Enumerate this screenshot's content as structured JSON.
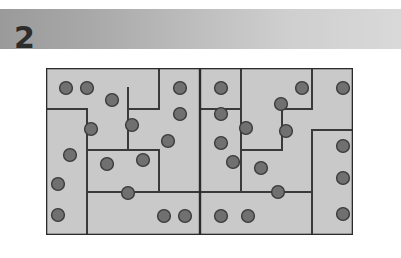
{
  "header": {
    "number_label": "2",
    "band_gradient_from": "#9a9a9a",
    "band_gradient_to": "#d9d9d9"
  },
  "puzzle": {
    "name": "dotted-region-grid-puzzle",
    "grid": {
      "columns": 15,
      "rows": 8,
      "cell_size": 20.45,
      "origin_x": 0,
      "origin_y": 0,
      "width": 307,
      "height": 167
    },
    "colors": {
      "background": "#c9c9c9",
      "border": "#2b2b2b",
      "region_line": "#3a3a3a",
      "dot_fill": "#707070",
      "dot_stroke": "#3b3b3b"
    },
    "center_divider_x": 154,
    "dots": [
      {
        "cx": 20,
        "cy": 20
      },
      {
        "cx": 41,
        "cy": 20
      },
      {
        "cx": 66,
        "cy": 32
      },
      {
        "cx": 134,
        "cy": 20
      },
      {
        "cx": 175,
        "cy": 20
      },
      {
        "cx": 256,
        "cy": 20
      },
      {
        "cx": 297,
        "cy": 20
      },
      {
        "cx": 134,
        "cy": 46
      },
      {
        "cx": 175,
        "cy": 46
      },
      {
        "cx": 235,
        "cy": 36
      },
      {
        "cx": 45,
        "cy": 61
      },
      {
        "cx": 86,
        "cy": 57
      },
      {
        "cx": 200,
        "cy": 60
      },
      {
        "cx": 240,
        "cy": 63
      },
      {
        "cx": 122,
        "cy": 73
      },
      {
        "cx": 175,
        "cy": 75
      },
      {
        "cx": 24,
        "cy": 87
      },
      {
        "cx": 297,
        "cy": 78
      },
      {
        "cx": 61,
        "cy": 96
      },
      {
        "cx": 97,
        "cy": 92
      },
      {
        "cx": 187,
        "cy": 94
      },
      {
        "cx": 215,
        "cy": 100
      },
      {
        "cx": 12,
        "cy": 116
      },
      {
        "cx": 297,
        "cy": 110
      },
      {
        "cx": 82,
        "cy": 125
      },
      {
        "cx": 232,
        "cy": 124
      },
      {
        "cx": 12,
        "cy": 147
      },
      {
        "cx": 118,
        "cy": 148
      },
      {
        "cx": 139,
        "cy": 148
      },
      {
        "cx": 175,
        "cy": 148
      },
      {
        "cx": 202,
        "cy": 148
      },
      {
        "cx": 297,
        "cy": 146
      }
    ],
    "region_lines": [
      {
        "x1": 0,
        "y1": 41,
        "x2": 41,
        "y2": 41
      },
      {
        "x1": 41,
        "y1": 41,
        "x2": 41,
        "y2": 82
      },
      {
        "x1": 41,
        "y1": 82,
        "x2": 82,
        "y2": 82
      },
      {
        "x1": 82,
        "y1": 82,
        "x2": 82,
        "y2": 41
      },
      {
        "x1": 82,
        "y1": 41,
        "x2": 82,
        "y2": 20
      },
      {
        "x1": 82,
        "y1": 41,
        "x2": 113,
        "y2": 41
      },
      {
        "x1": 113,
        "y1": 41,
        "x2": 113,
        "y2": 0
      },
      {
        "x1": 82,
        "y1": 82,
        "x2": 113,
        "y2": 82
      },
      {
        "x1": 113,
        "y1": 82,
        "x2": 113,
        "y2": 124
      },
      {
        "x1": 41,
        "y1": 82,
        "x2": 41,
        "y2": 124
      },
      {
        "x1": 41,
        "y1": 124,
        "x2": 41,
        "y2": 167
      },
      {
        "x1": 41,
        "y1": 124,
        "x2": 113,
        "y2": 124
      },
      {
        "x1": 113,
        "y1": 124,
        "x2": 154,
        "y2": 124
      },
      {
        "x1": 154,
        "y1": 0,
        "x2": 154,
        "y2": 167
      },
      {
        "x1": 154,
        "y1": 41,
        "x2": 195,
        "y2": 41
      },
      {
        "x1": 195,
        "y1": 41,
        "x2": 195,
        "y2": 0
      },
      {
        "x1": 195,
        "y1": 41,
        "x2": 195,
        "y2": 82
      },
      {
        "x1": 195,
        "y1": 82,
        "x2": 236,
        "y2": 82
      },
      {
        "x1": 236,
        "y1": 82,
        "x2": 236,
        "y2": 41
      },
      {
        "x1": 236,
        "y1": 41,
        "x2": 266,
        "y2": 41
      },
      {
        "x1": 266,
        "y1": 41,
        "x2": 266,
        "y2": 0
      },
      {
        "x1": 154,
        "y1": 124,
        "x2": 195,
        "y2": 124
      },
      {
        "x1": 195,
        "y1": 124,
        "x2": 195,
        "y2": 82
      },
      {
        "x1": 195,
        "y1": 124,
        "x2": 266,
        "y2": 124
      },
      {
        "x1": 266,
        "y1": 124,
        "x2": 266,
        "y2": 167
      },
      {
        "x1": 266,
        "y1": 62,
        "x2": 307,
        "y2": 62
      },
      {
        "x1": 266,
        "y1": 62,
        "x2": 266,
        "y2": 124
      }
    ]
  }
}
